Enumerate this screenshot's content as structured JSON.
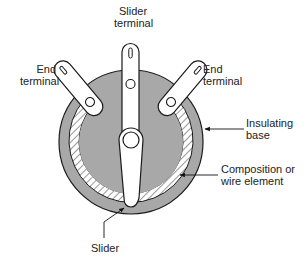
{
  "diagram": {
    "labels": {
      "slider_terminal": {
        "line1": "Slider",
        "line2": "terminal"
      },
      "end_terminal_left": {
        "line1": "End",
        "line2": "terminal"
      },
      "end_terminal_right": {
        "line1": "End",
        "line2": "terminal"
      },
      "insulating_base": {
        "line1": "Insulating",
        "line2": "base"
      },
      "element": {
        "line1": "Composition or",
        "line2": "wire element"
      },
      "slider": {
        "line1": "Slider"
      }
    },
    "colors": {
      "base_fill": "#a8a8a8",
      "outline": "#1a1a1a",
      "background": "#ffffff",
      "terminal_fill": "#ffffff"
    }
  }
}
